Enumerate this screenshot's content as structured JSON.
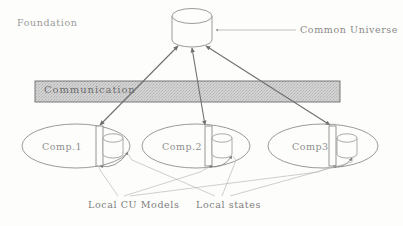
{
  "figure": {
    "background_color": "#fdfdfb",
    "ink_color": "#8a8a8a",
    "bar_fill_color": "#cfcfcf",
    "bar_border_color": "#6b6b6b"
  },
  "labels": {
    "foundation": "Foundation",
    "common_universe": "Common Universe",
    "communication": "Communication",
    "local_cu_models": "Local CU Models",
    "local_states": "Local states"
  },
  "components": [
    {
      "name": "Comp.1"
    },
    {
      "name": "Comp.2"
    },
    {
      "name": "Comp3"
    }
  ]
}
